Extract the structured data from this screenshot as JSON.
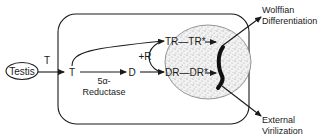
{
  "diagram": {
    "nodes": {
      "testis": "Testis",
      "t_secreted": "T",
      "t_cell": "T",
      "d": "D",
      "plus_r": "+R",
      "tr_complex": "TR—TR*",
      "dr_complex": "DR—DR*"
    },
    "enzyme": {
      "line1": "5α-",
      "line2": "Reductase"
    },
    "outcomes": {
      "wolffian_line1": "Wolffian",
      "wolffian_line2": "Differentiation",
      "external_line1": "External",
      "external_line2": "Virilization"
    },
    "edges": [
      {
        "from": "Testis",
        "to": "T (cell)",
        "label": "T"
      },
      {
        "from": "T (cell)",
        "to": "D",
        "label": "5α-Reductase"
      },
      {
        "from": "T (cell)",
        "to": "TR"
      },
      {
        "from": "D",
        "to": "DR"
      },
      {
        "from": "TR—TR*",
        "to": "DNA"
      },
      {
        "from": "DR—DR*",
        "to": "DNA"
      },
      {
        "from": "nucleus",
        "to": "Wolffian Differentiation"
      },
      {
        "from": "nucleus",
        "to": "External Virilization"
      }
    ],
    "colors": {
      "ink": "#1a1a1a",
      "stipple": "#9a9a9a",
      "background": "#ffffff"
    }
  }
}
